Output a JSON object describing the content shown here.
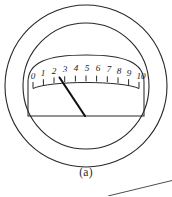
{
  "figure": {
    "caption": "(a)",
    "device_type": "analog-panel-meter",
    "colors": {
      "line": "#28282c",
      "needle": "#111114",
      "background": "#ffffff",
      "text": "#1c1c20"
    }
  },
  "bezel": {
    "outer_circle": {
      "cx": 86,
      "cy": 86,
      "r": 81
    },
    "inner_circle": {
      "cx": 86,
      "cy": 86,
      "r": 63
    }
  },
  "dial_face": {
    "left": 28,
    "right": 144,
    "top": 56,
    "baseline_y": 116,
    "corner_radius": 26
  },
  "scale": {
    "min": 0,
    "max": 10,
    "tick_labels": [
      "0",
      "1",
      "2",
      "3",
      "4",
      "5",
      "6",
      "7",
      "8",
      "9",
      "10"
    ],
    "major_tick_count": 11,
    "label_positions": [
      {
        "label": "0",
        "x": 33,
        "y": 79
      },
      {
        "label": "1",
        "x": 43,
        "y": 76
      },
      {
        "label": "2",
        "x": 54,
        "y": 73.5
      },
      {
        "label": "3",
        "x": 65,
        "y": 72
      },
      {
        "label": "4",
        "x": 76,
        "y": 71
      },
      {
        "label": "5",
        "x": 87,
        "y": 70.8
      },
      {
        "label": "6",
        "x": 98,
        "y": 71
      },
      {
        "label": "7",
        "x": 109,
        "y": 72
      },
      {
        "label": "8",
        "x": 119,
        "y": 73.5
      },
      {
        "label": "9",
        "x": 129,
        "y": 76
      },
      {
        "label": "10",
        "x": 140,
        "y": 79
      }
    ]
  },
  "needle": {
    "pivot": {
      "x": 85,
      "y": 116
    },
    "tip": {
      "x": 59.5,
      "y": 77.5
    },
    "indicated_value": "2"
  },
  "stray_line": {
    "description": "edge-of-adjacent-figure",
    "x1": 108,
    "y1": 196,
    "x2": 172,
    "y2": 180
  }
}
